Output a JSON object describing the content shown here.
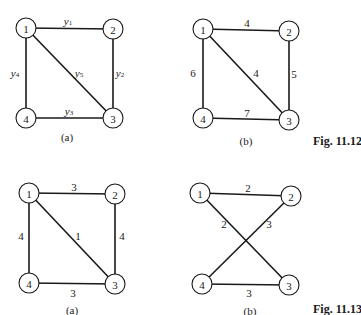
{
  "figures": [
    {
      "id": "fig-11-12",
      "label": "Fig. 11.12",
      "graphs": [
        {
          "caption": "(a)",
          "nodes": [
            {
              "id": "1",
              "x": 26,
              "y": 28
            },
            {
              "id": "2",
              "x": 113,
              "y": 29
            },
            {
              "id": "3",
              "x": 113,
              "y": 118
            },
            {
              "id": "4",
              "x": 26,
              "y": 118
            }
          ],
          "edges": [
            {
              "from": "1",
              "to": "2",
              "label": "y",
              "sub": "1",
              "lx": 68,
              "ly": 21
            },
            {
              "from": "2",
              "to": "3",
              "label": "y",
              "sub": "2",
              "lx": 120,
              "ly": 73
            },
            {
              "from": "4",
              "to": "3",
              "label": "y",
              "sub": "3",
              "lx": 69,
              "ly": 111
            },
            {
              "from": "1",
              "to": "4",
              "label": "y",
              "sub": "4",
              "lx": 15,
              "ly": 73
            },
            {
              "from": "1",
              "to": "3",
              "label": "y",
              "sub": "5",
              "lx": 79,
              "ly": 73
            }
          ]
        },
        {
          "caption": "(b)",
          "nodes": [
            {
              "id": "1",
              "x": 203,
              "y": 29
            },
            {
              "id": "2",
              "x": 289,
              "y": 31
            },
            {
              "id": "3",
              "x": 289,
              "y": 120
            },
            {
              "id": "4",
              "x": 203,
              "y": 118
            }
          ],
          "edges": [
            {
              "from": "1",
              "to": "2",
              "label": "4",
              "lx": 247,
              "ly": 23
            },
            {
              "from": "2",
              "to": "3",
              "label": "5",
              "lx": 294,
              "ly": 74
            },
            {
              "from": "4",
              "to": "3",
              "label": "7",
              "lx": 247,
              "ly": 113
            },
            {
              "from": "1",
              "to": "4",
              "label": "6",
              "lx": 193,
              "ly": 73
            },
            {
              "from": "1",
              "to": "3",
              "label": "4",
              "lx": 256,
              "ly": 73
            }
          ]
        }
      ]
    },
    {
      "id": "fig-11-13",
      "label": "Fig. 11.13",
      "graphs": [
        {
          "caption": "(a)",
          "nodes": [
            {
              "id": "1",
              "x": 29,
              "y": 193
            },
            {
              "id": "2",
              "x": 115,
              "y": 194
            },
            {
              "id": "3",
              "x": 115,
              "y": 284
            },
            {
              "id": "4",
              "x": 29,
              "y": 283
            }
          ],
          "edges": [
            {
              "from": "1",
              "to": "2",
              "label": "3",
              "lx": 74,
              "ly": 187
            },
            {
              "from": "2",
              "to": "3",
              "label": "4",
              "lx": 122,
              "ly": 236
            },
            {
              "from": "4",
              "to": "3",
              "label": "3",
              "lx": 73,
              "ly": 293
            },
            {
              "from": "1",
              "to": "4",
              "label": "4",
              "lx": 21,
              "ly": 236
            },
            {
              "from": "1",
              "to": "3",
              "label": "1",
              "lx": 78,
              "ly": 236
            }
          ]
        },
        {
          "caption": "(b)",
          "nodes": [
            {
              "id": "1",
              "x": 200,
              "y": 193
            },
            {
              "id": "2",
              "x": 291,
              "y": 196
            },
            {
              "id": "3",
              "x": 289,
              "y": 285
            },
            {
              "id": "4",
              "x": 202,
              "y": 284
            }
          ],
          "edges": [
            {
              "from": "1",
              "to": "2",
              "label": "2",
              "lx": 248,
              "ly": 188
            },
            {
              "from": "1",
              "to": "3",
              "label": "2",
              "lx": 224,
              "ly": 224
            },
            {
              "from": "4",
              "to": "2",
              "label": "3",
              "lx": 269,
              "ly": 224
            },
            {
              "from": "4",
              "to": "3",
              "label": "3",
              "lx": 249,
              "ly": 293
            }
          ]
        }
      ]
    }
  ],
  "captions": {
    "fig12a": "(a)",
    "fig12b": "(b)",
    "fig13a": "(a)",
    "fig13b": "(b)",
    "fig12_label": "Fig. 11.12",
    "fig13_label": "Fig. 11.13"
  }
}
